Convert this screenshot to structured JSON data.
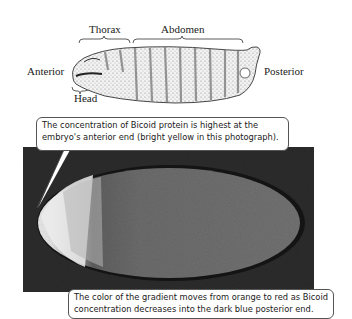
{
  "diagram": {
    "drawing_labels": {
      "thorax": "Thorax",
      "abdomen": "Abdomen",
      "anterior": "Anterior",
      "posterior": "Posterior",
      "head": "Head"
    },
    "callouts": {
      "top": {
        "line1": "The concentration of Bicoid protein is highest at the",
        "line2": "embryo's anterior end (bright yellow in this photograph)."
      },
      "bottom": {
        "line1": "The color of the gradient moves from orange to red as Bicoid",
        "line2": "concentration decreases into the dark blue posterior end."
      }
    },
    "colors": {
      "background": "#ffffff",
      "photo_background": "#2a2a2a",
      "anterior_bright": "#e8e8e8",
      "mid_gradient": "#a8a8a8",
      "posterior_body": "#6e6e6e",
      "outline": "#1a1a1a"
    }
  }
}
